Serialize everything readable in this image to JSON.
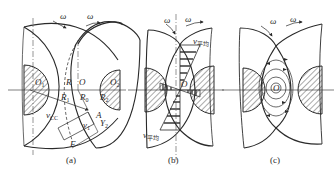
{
  "figure": {
    "panels": [
      {
        "id": "a",
        "caption": "(a)",
        "labels": {
          "omega_left": "ω",
          "omega_right": "ω",
          "O1": "O",
          "O1_sub": "1",
          "O2": "O",
          "O2_sub": "2",
          "R": "R",
          "O": "O",
          "R1": "R",
          "R1_sub": "1",
          "R0": "R",
          "R0_sub": "0",
          "R2": "R",
          "R2_sub": "2",
          "vcc": "v",
          "vcc_sub": "CC",
          "A": "A",
          "v1": "v",
          "v1_sub": "1",
          "Y2": "Y",
          "Y2_sub": "2",
          "F": "F"
        }
      },
      {
        "id": "b",
        "caption": "(b)",
        "labels": {
          "omega_left": "ω",
          "omega_right": "ω",
          "v_avg_top": "v",
          "v_avg_top_sub": "平均",
          "v_avg_bottom": "v",
          "v_avg_bottom_sub": "平均",
          "O": "O"
        }
      },
      {
        "id": "c",
        "caption": "(c)",
        "labels": {
          "omega_left": "ω",
          "omega_right": "ω",
          "O": "O"
        }
      }
    ],
    "colors": {
      "line": "#2a2a2a",
      "background": "#ffffff"
    }
  }
}
